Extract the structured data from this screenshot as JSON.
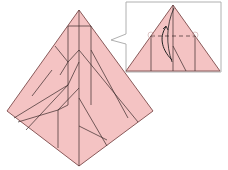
{
  "diagram": {
    "type": "origami-step",
    "colors": {
      "paper": "#f4c3c3",
      "edge": "#8a5a5a",
      "crease": "#3a2a2a",
      "callout_border": "#b0b0b0",
      "background": "#ffffff"
    },
    "main_model": {
      "shape": "kite",
      "points": {
        "top": [
          79,
          10
        ],
        "left": [
          7,
          111
        ],
        "right": [
          153,
          111
        ],
        "bottom": [
          79,
          166
        ]
      }
    },
    "inset": {
      "box": {
        "x": 126,
        "y": 2,
        "w": 95,
        "h": 70
      },
      "triangle": {
        "apex": [
          173,
          5
        ],
        "left": [
          126,
          71
        ],
        "right": [
          220,
          71
        ]
      },
      "fold_line": "valley",
      "arrow": "fold-up"
    }
  }
}
